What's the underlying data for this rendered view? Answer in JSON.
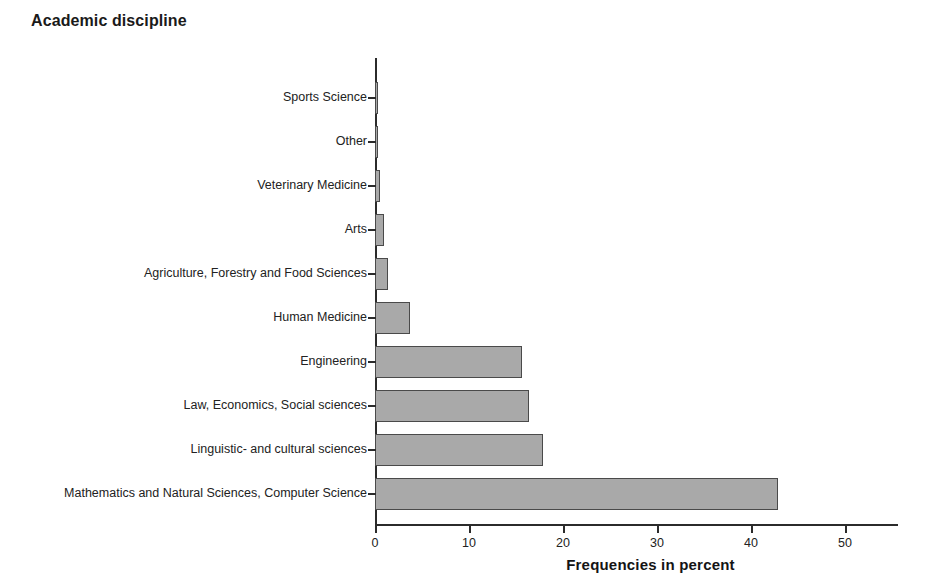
{
  "chart_data": {
    "type": "bar",
    "orientation": "horizontal",
    "title": "Academic discipline",
    "xlabel": "Frequencies in percent",
    "ylabel": "",
    "xlim": [
      0,
      55.5
    ],
    "xticks": [
      0,
      10,
      20,
      30,
      40,
      50
    ],
    "xtick_labels": [
      "0",
      "10",
      "20",
      "30",
      "40",
      "50"
    ],
    "grid": false,
    "legend": null,
    "bar_fill_color": "#a9a9a9",
    "bar_border_color": "#4a4a4a",
    "axis_color": "#2b2b2b",
    "background_color": "#ffffff",
    "categories": [
      "Sports Science",
      "Other",
      "Veterinary Medicine",
      "Arts",
      "Agriculture, Forestry and Food Sciences",
      "Human Medicine",
      "Engineering",
      "Law, Economics, Social sciences",
      "Linguistic- and cultural sciences",
      "Mathematics and Natural Sciences, Computer Science"
    ],
    "values": [
      0.2,
      0.3,
      0.5,
      1.0,
      1.4,
      3.7,
      15.6,
      16.4,
      17.9,
      42.9
    ]
  }
}
